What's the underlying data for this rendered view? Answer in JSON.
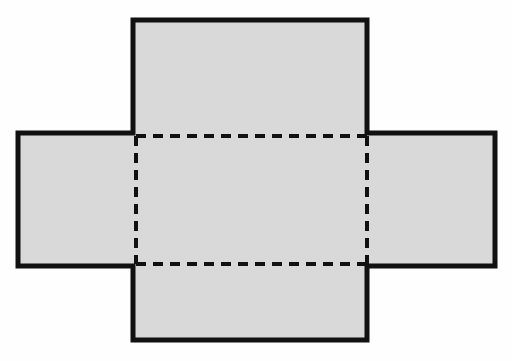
{
  "figure": {
    "title": "Net of a rectangular box (cross-shaped unfolding)",
    "canvas": {
      "width": 512,
      "height": 361
    },
    "background_color": "#fefefe",
    "fill_color": "#d9d9d9",
    "stroke_color": "#111111",
    "solid_stroke_width": 5,
    "dashed_stroke_width": 4,
    "dash_pattern": "10 7"
  },
  "chart_data": {
    "type": "diagram",
    "title": "Net of a rectangular box (cross-shaped unfolding)",
    "shape": "cross",
    "units": "pixels",
    "panels": [
      {
        "name": "top-flap",
        "label": "top flap",
        "x": 133,
        "y": 20,
        "width": 234,
        "height": 116
      },
      {
        "name": "left-flap",
        "label": "left flap",
        "x": 18,
        "y": 133,
        "width": 118,
        "height": 133
      },
      {
        "name": "center-face",
        "label": "center face",
        "x": 136,
        "y": 136,
        "width": 231,
        "height": 128
      },
      {
        "name": "right-flap",
        "label": "right flap",
        "x": 367,
        "y": 133,
        "width": 128,
        "height": 133
      },
      {
        "name": "bottom-flap",
        "label": "bottom flap",
        "x": 133,
        "y": 264,
        "width": 234,
        "height": 76
      }
    ],
    "outline_points": [
      [
        133,
        20
      ],
      [
        367,
        20
      ],
      [
        367,
        133
      ],
      [
        495,
        133
      ],
      [
        495,
        266
      ],
      [
        367,
        266
      ],
      [
        367,
        340
      ],
      [
        133,
        340
      ],
      [
        133,
        266
      ],
      [
        18,
        266
      ],
      [
        18,
        133
      ],
      [
        133,
        133
      ]
    ],
    "fold_lines": [
      {
        "name": "fold-top",
        "style": "dashed",
        "x1": 136,
        "y1": 136,
        "x2": 367,
        "y2": 136
      },
      {
        "name": "fold-bottom",
        "style": "dashed",
        "x1": 136,
        "y1": 264,
        "x2": 367,
        "y2": 264
      },
      {
        "name": "fold-left",
        "style": "dashed",
        "x1": 136,
        "y1": 136,
        "x2": 136,
        "y2": 264
      },
      {
        "name": "fold-right",
        "style": "dashed",
        "x1": 367,
        "y1": 136,
        "x2": 367,
        "y2": 264
      }
    ],
    "legend": [],
    "annotations": []
  }
}
